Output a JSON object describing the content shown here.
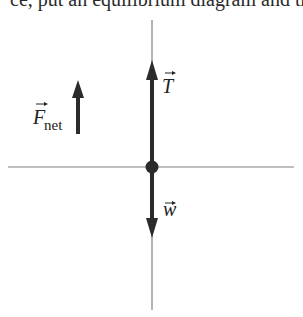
{
  "header": {
    "clipped_text": "ce, put an equilibrium diagram and the net force vector."
  },
  "diagram": {
    "type": "free-body-diagram",
    "labels": {
      "net_force": "F",
      "net_force_subscript": "net",
      "tension": "T",
      "weight": "w"
    },
    "colors": {
      "axis": "#777777",
      "vector": "#2b2b2b",
      "particle": "#2b2b2b"
    },
    "vectors": [
      {
        "name": "T",
        "direction": "up"
      },
      {
        "name": "w",
        "direction": "down"
      },
      {
        "name": "F_net",
        "direction": "up"
      }
    ]
  }
}
